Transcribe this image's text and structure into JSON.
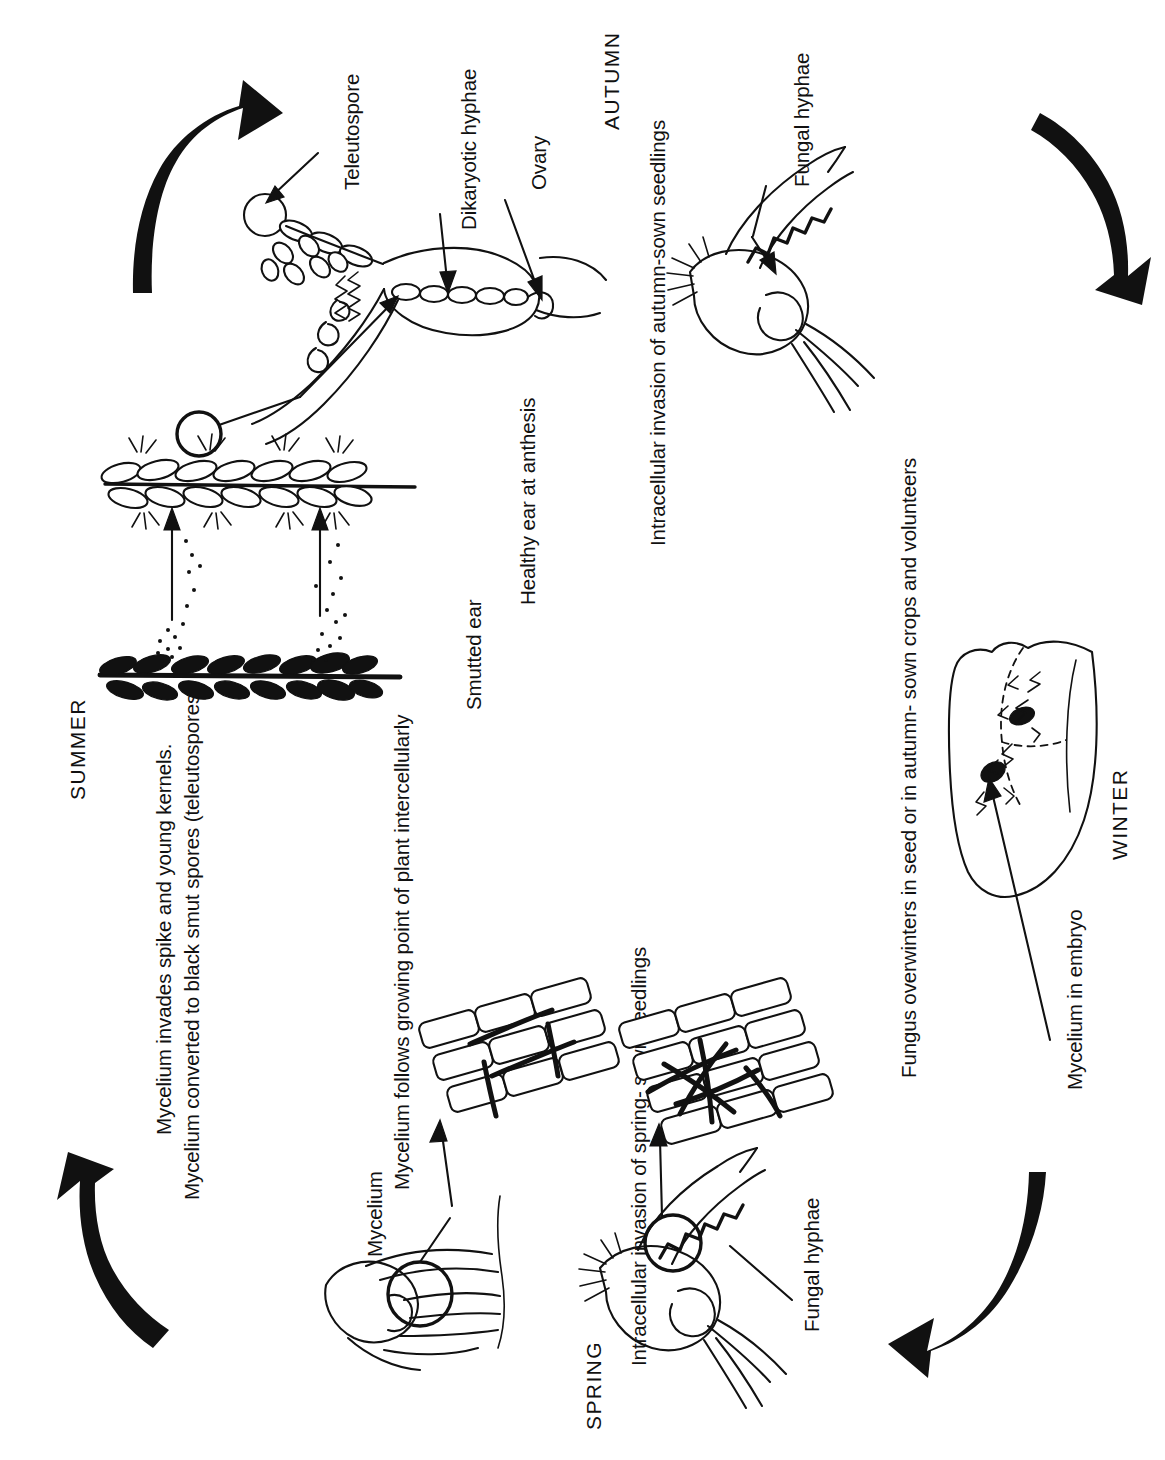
{
  "diagram": {
    "background_color": "#ffffff",
    "ink_color": "#111111",
    "text_orientation": "rotated-90-ccw"
  },
  "seasons": {
    "summer": "SUMMER",
    "autumn": "AUTUMN",
    "winter": "WINTER",
    "spring": "SPRING"
  },
  "labels": {
    "teleutospore": "Teleutospore",
    "dikaryotic_hyphae": "Dikaryotic hyphae",
    "ovary": "Ovary",
    "fungal_hyphae_autumn": "Fungal hyphae",
    "fungal_hyphae_spring": "Fungal hyphae",
    "smutted_ear": "Smutted ear",
    "healthy_ear": "Healthy ear at anthesis",
    "mycelium_in_embryo": "Mycelium in embryo",
    "mycelium_label": "Mycelium"
  },
  "captions": {
    "summer_line1": "Mycelium invades spike and young kernels.",
    "summer_line2": "Mycelium converted to black smut spores (teleutospores)",
    "summer_line3": "Mycelium follows growing point of plant intercellularly",
    "autumn_caption": "Intracellular invasion of autumn-sown seedlings",
    "winter_caption": "Fungus overwinters in seed or in autumn- sown crops and volunteers",
    "spring_caption": "Intracellular invasion of spring- sown seedlings"
  },
  "cycle_arrows": [
    {
      "name": "summer-to-autumn",
      "direction": "up-right",
      "position": "top-left"
    },
    {
      "name": "autumn-to-winter",
      "direction": "down-right",
      "position": "top-right"
    },
    {
      "name": "winter-to-spring",
      "direction": "down-left",
      "position": "bottom-right"
    },
    {
      "name": "spring-to-summer",
      "direction": "up-left",
      "position": "bottom-left"
    }
  ],
  "illustrations": [
    {
      "name": "teleutospore-germination",
      "description": "Teleutospore with promycelium and dikaryotic hyphae penetrating wheat ovary"
    },
    {
      "name": "healthy-wheat-ear",
      "description": "Healthy wheat ear at anthesis, outline drawing"
    },
    {
      "name": "smutted-wheat-ear",
      "description": "Smutted ear with black masses of teleutospores"
    },
    {
      "name": "spore-dispersal",
      "description": "Dotted spore cloud rising from smutted ear to healthy ear with two arrows"
    },
    {
      "name": "autumn-seedling",
      "description": "Germinating seed and coleoptile with fungal hyphae inside"
    },
    {
      "name": "wheat-seed-embryo",
      "description": "Wheat seed in section showing dashed embryo region with dark mycelium"
    },
    {
      "name": "spring-seedling",
      "description": "Germinating seed with magnifying circle over coleoptile"
    },
    {
      "name": "cell-tissue-invaded",
      "description": "Block of plant cells with dark branching hyphae between and inside cells"
    },
    {
      "name": "cell-tissue-intercellular",
      "description": "Block of plant cells with hyphae following intercellularly"
    },
    {
      "name": "growing-point-seedling",
      "description": "Seedling with circled growing point and mycelium"
    }
  ]
}
